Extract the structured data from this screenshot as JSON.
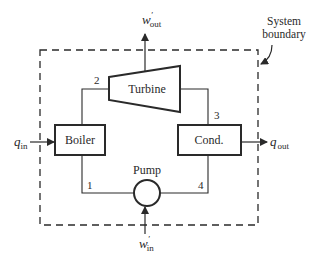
{
  "diagram": {
    "boundary_label_line1": "System",
    "boundary_label_line2": "boundary",
    "components": {
      "turbine": "Turbine",
      "boiler": "Boiler",
      "condenser": "Cond.",
      "pump": "Pump"
    },
    "state_points": {
      "p1": "1",
      "p2": "2",
      "p3": "3",
      "p4": "4"
    },
    "flows": {
      "w_out": {
        "base": "w",
        "prime": "′",
        "sub": "out"
      },
      "w_in": {
        "base": "w",
        "prime": "′",
        "sub": "in"
      },
      "q_in": {
        "base": "q",
        "sub": "in"
      },
      "q_out": {
        "base": "q",
        "sub": "out"
      }
    },
    "colors": {
      "line": "#2a2a2a",
      "background": "#ffffff"
    }
  }
}
